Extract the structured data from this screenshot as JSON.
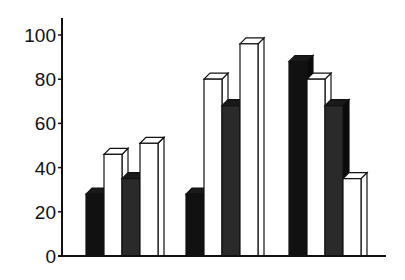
{
  "chart_data": {
    "type": "bar",
    "title": "",
    "xlabel": "",
    "ylabel": "",
    "ylim": [
      0,
      100
    ],
    "yticks": [
      0,
      20,
      40,
      60,
      80,
      100
    ],
    "categories": [
      "Group 1",
      "Group 2",
      "Group 3"
    ],
    "category_labels_visible": false,
    "legend": null,
    "grid": false,
    "style": "3d-bars",
    "series": [
      {
        "name": "Series 1",
        "fill": "#111111",
        "values": [
          28,
          28,
          88
        ]
      },
      {
        "name": "Series 2",
        "fill": "#ffffff",
        "values": [
          46,
          80,
          80
        ]
      },
      {
        "name": "Series 3",
        "fill": "#2a2a2a",
        "values": [
          35,
          68,
          68
        ]
      },
      {
        "name": "Series 4",
        "fill": "#ffffff",
        "values": [
          51,
          96,
          35
        ]
      }
    ]
  }
}
